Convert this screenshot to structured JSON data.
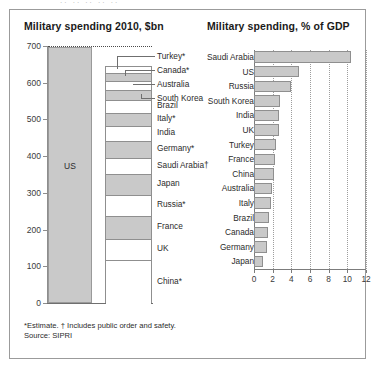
{
  "top_strip_text": "..  ..   ..  ..  ..",
  "ghost_text": "",
  "footnotes": {
    "estimate_note": "*Estimate.  † Includes public order and safety.",
    "source": "Source: SIPRI"
  },
  "chart_data": [
    {
      "type": "bar",
      "title": "Military spending 2010, $bn",
      "xlabel": "",
      "ylabel": "",
      "ylim": [
        0,
        700
      ],
      "yticks": [
        0,
        100,
        200,
        300,
        400,
        500,
        600,
        700
      ],
      "ytick_labels": [
        "0",
        "100",
        "200",
        "300",
        "400",
        "500",
        "600",
        "700"
      ],
      "grid": false,
      "legend": "none",
      "bars": [
        {
          "name": "US",
          "label": "US",
          "value": 698,
          "shaded": true
        }
      ],
      "stack_name": "Next 14 countries",
      "stack_total": 660,
      "categories": [
        "Turkey*",
        "Canada*",
        "Australia",
        "South Korea",
        "Brazil",
        "Italy*",
        "India",
        "Germany*",
        "Saudi Arabia†",
        "Japan",
        "Russia*",
        "France",
        "UK",
        "China*"
      ],
      "values": [
        17,
        22,
        24,
        28,
        34,
        37,
        41,
        45,
        45,
        55,
        59,
        62,
        58,
        119
      ],
      "stack_segments": [
        {
          "name": "Turkey*",
          "value": 17,
          "shaded": false,
          "leader": true
        },
        {
          "name": "Canada*",
          "value": 22,
          "shaded": true,
          "leader": true
        },
        {
          "name": "Australia",
          "value": 24,
          "shaded": false,
          "leader": true
        },
        {
          "name": "South Korea",
          "value": 28,
          "shaded": true,
          "leader": true
        },
        {
          "name": "Brazil",
          "value": 34,
          "shaded": false,
          "leader": false
        },
        {
          "name": "Italy*",
          "value": 37,
          "shaded": true,
          "leader": false
        },
        {
          "name": "India",
          "value": 41,
          "shaded": false,
          "leader": false
        },
        {
          "name": "Germany*",
          "value": 45,
          "shaded": true,
          "leader": false
        },
        {
          "name": "Saudi Arabia†",
          "value": 45,
          "shaded": false,
          "leader": false
        },
        {
          "name": "Japan",
          "value": 55,
          "shaded": true,
          "leader": false
        },
        {
          "name": "Russia*",
          "value": 59,
          "shaded": false,
          "leader": false
        },
        {
          "name": "France",
          "value": 62,
          "shaded": true,
          "leader": false
        },
        {
          "name": "UK",
          "value": 58,
          "shaded": false,
          "leader": false
        },
        {
          "name": "China*",
          "value": 119,
          "shaded": false,
          "leader": false
        }
      ]
    },
    {
      "type": "bar",
      "orientation": "horizontal",
      "title": "Military spending, % of GDP",
      "xlabel": "",
      "ylabel": "",
      "xlim": [
        0,
        12
      ],
      "xticks": [
        0,
        2,
        4,
        6,
        8,
        10,
        12
      ],
      "xtick_labels": [
        "0",
        "2",
        "4",
        "6",
        "8",
        "10",
        "12"
      ],
      "grid": true,
      "legend": "none",
      "categories": [
        "Saudi Arabia",
        "US",
        "Russia",
        "South Korea",
        "India",
        "UK",
        "Turkey",
        "France",
        "China",
        "Australia",
        "Italy",
        "Brazil",
        "Canada",
        "Germany",
        "Japan"
      ],
      "values": [
        10.4,
        4.8,
        4.0,
        2.8,
        2.7,
        2.7,
        2.4,
        2.3,
        2.1,
        1.9,
        1.8,
        1.6,
        1.5,
        1.4,
        1.0
      ]
    }
  ],
  "colors": {
    "bar_fill": "#c9c9c9",
    "bar_stroke": "#8f8f8f",
    "axis": "#7c7c7c",
    "frame": "#9b9b9b",
    "text": "#231f20"
  }
}
